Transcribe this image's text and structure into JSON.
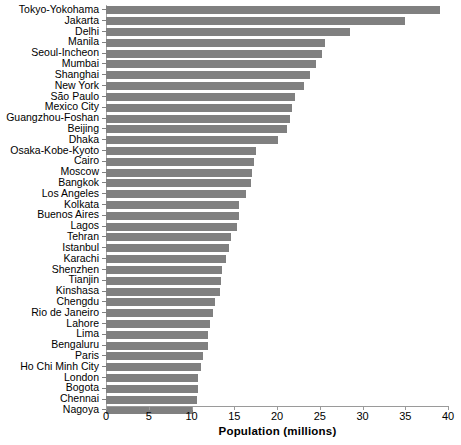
{
  "chart_data": {
    "type": "bar",
    "orientation": "horizontal",
    "title": "",
    "xlabel": "Population (millions)",
    "ylabel": "",
    "xlim": [
      0,
      40
    ],
    "xticks": [
      0,
      5,
      10,
      15,
      20,
      25,
      30,
      35,
      40
    ],
    "grid": false,
    "legend": null,
    "bar_color": "#808080",
    "axis_color": "#9a9a9a",
    "categories": [
      "Tokyo-Yokohama",
      "Jakarta",
      "Delhi",
      "Manila",
      "Seoul-Incheon",
      "Mumbai",
      "Shanghai",
      "New York",
      "São Paulo",
      "Mexico City",
      "Guangzhou-Foshan",
      "Beijing",
      "Dhaka",
      "Osaka-Kobe-Kyoto",
      "Cairo",
      "Moscow",
      "Bangkok",
      "Los Angeles",
      "Kolkata",
      "Buenos Aires",
      "Lagos",
      "Tehran",
      "Istanbul",
      "Karachi",
      "Shenzhen",
      "Tianjin",
      "Kinshasa",
      "Chengdu",
      "Rio de Janeiro",
      "Lahore",
      "Lima",
      "Bengaluru",
      "Paris",
      "Ho Chi Minh City",
      "London",
      "Bogota",
      "Chennai",
      "Nagoya"
    ],
    "values": [
      39.1,
      35.0,
      28.5,
      25.6,
      25.3,
      24.6,
      23.9,
      23.1,
      22.1,
      21.8,
      21.5,
      21.2,
      20.1,
      17.5,
      17.3,
      17.1,
      17.0,
      16.4,
      15.6,
      15.5,
      15.3,
      14.6,
      14.4,
      14.0,
      13.6,
      13.4,
      13.3,
      12.7,
      12.5,
      12.2,
      11.9,
      11.9,
      11.3,
      11.1,
      10.8,
      10.8,
      10.7,
      10.2
    ],
    "value_unit": "millions"
  }
}
